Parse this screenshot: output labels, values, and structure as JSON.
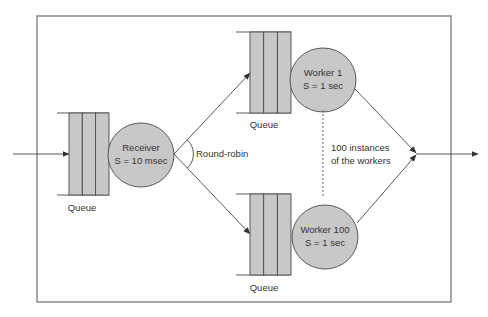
{
  "diagram": {
    "type": "queueing-network",
    "frame": {
      "stroke_color": "#8a8a8a"
    },
    "colors": {
      "fill": "#c8c8c8",
      "stroke": "#4a4a4a",
      "text": "#333333"
    },
    "receiver": {
      "queue_label": "Queue",
      "name": "Receiver",
      "service_time": "S = 10 msec"
    },
    "dispatch_label": "Round-robin",
    "workers": [
      {
        "queue_label": "Queue",
        "name": "Worker 1",
        "service_time": "S = 1 sec"
      },
      {
        "queue_label": "Queue",
        "name": "Worker 100",
        "service_time": "S = 1 sec"
      }
    ],
    "instances_note": {
      "line1": "100 instances",
      "line2": "of the workers"
    }
  }
}
